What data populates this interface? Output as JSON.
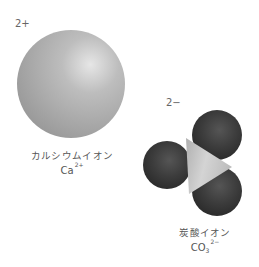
{
  "calcium_ion": {
    "charge": "2+",
    "name": "カルシウムイオン",
    "symbol": "Ca",
    "superscript": "2+",
    "color": "#b5b5b5"
  },
  "carbonate_ion": {
    "charge": "2−",
    "name": "炭酸イオン",
    "symbol": "CO",
    "subscript": "3",
    "superscript": "2−",
    "oxygen_color": "#3a3a3a",
    "carbon_color": "#c8c8c8"
  }
}
